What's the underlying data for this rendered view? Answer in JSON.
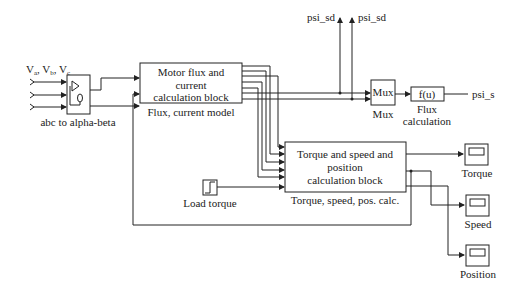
{
  "diagram": {
    "inputs": {
      "label_parts": [
        "V",
        "a",
        ", V",
        "b",
        ", V",
        "c"
      ],
      "count": 3
    },
    "blocks": {
      "abc": {
        "caption": "abc to alpha-beta",
        "icon": "transform-icon"
      },
      "flux_model": {
        "lines": [
          "Motor flux and",
          "current",
          "calculation block"
        ],
        "caption": "Flux, current model"
      },
      "mux": {
        "label": "Mux",
        "caption": "Mux"
      },
      "fcn": {
        "label": "f(u)",
        "caption_lines": [
          "Flux",
          "calculation"
        ]
      },
      "torque_calc": {
        "lines": [
          "Torque and speed and",
          "position",
          "calculation block"
        ],
        "caption": "Torque, speed, pos. calc."
      },
      "load_torque": {
        "caption": "Load torque",
        "icon": "step-icon"
      },
      "scope_torque": {
        "caption": "Torque",
        "icon": "scope-icon"
      },
      "scope_speed": {
        "caption": "Speed",
        "icon": "scope-icon"
      },
      "scope_position": {
        "caption": "Position",
        "icon": "scope-icon"
      }
    },
    "outputs": {
      "psi_sd_left": "psi_sd",
      "psi_sd_right": "psi_sd",
      "psi_s": "psi_s"
    }
  }
}
